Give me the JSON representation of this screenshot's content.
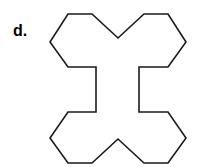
{
  "figure": {
    "label": "d.",
    "background_color": "#ffffff",
    "stroke_color": "#1a1a1a",
    "fill_color": "#ffffff",
    "stroke_width": 1.6,
    "shape_name": "x-shaped-polygon",
    "vertex_count": 20,
    "symmetry": "bilateral-vertical-and-horizontal",
    "center_x": 118,
    "center_y": 89,
    "points": "68,14 92,14 118,38 144,14 168,14 186,42 168,67 139,67 139,112 168,112 186,138 168,163 144,163 118,139 92,163 68,163 50,138 68,112 96,112 96,67 68,67 50,42"
  }
}
